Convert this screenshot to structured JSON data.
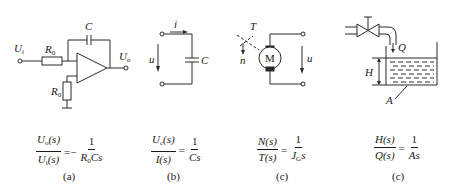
{
  "figure": {
    "panels": [
      {
        "id": "a",
        "caption": "(a)",
        "labels": {
          "input": "U",
          "input_sub": "i",
          "output": "U",
          "output_sub": "o",
          "resistor1": "R",
          "resistor1_sub": "0",
          "resistor2": "R",
          "resistor2_sub": "0",
          "capacitor": "C"
        },
        "equation": {
          "lhs_num": "U",
          "lhs_num_sub": "o",
          "lhs_num_arg": "(s)",
          "lhs_den": "U",
          "lhs_den_sub": "i",
          "lhs_den_arg": "(s)",
          "sign": "=−",
          "rhs_num": "1",
          "rhs_den": "R",
          "rhs_den_sub": "0",
          "rhs_den_rest": "Cs"
        }
      },
      {
        "id": "b",
        "caption": "(b)",
        "labels": {
          "current": "i",
          "voltage": "u",
          "capacitor": "C"
        },
        "equation": {
          "lhs_num": "U",
          "lhs_num_sub": "c",
          "lhs_num_arg": "(s)",
          "lhs_den": "I(s)",
          "sign": "=",
          "rhs_num": "1",
          "rhs_den": "Cs"
        }
      },
      {
        "id": "c1",
        "caption": "(c)",
        "labels": {
          "torque": "T",
          "speed": "n",
          "motor": "M",
          "voltage": "u"
        },
        "equation": {
          "lhs_num": "N(s)",
          "lhs_den": "T(s)",
          "sign": "=",
          "rhs_num": "1",
          "rhs_den": "J",
          "rhs_den_sub": "G",
          "rhs_den_rest": "s"
        }
      },
      {
        "id": "c2",
        "caption": "(c)",
        "labels": {
          "flow": "Q",
          "height": "H",
          "area": "A"
        },
        "equation": {
          "lhs_num": "H(s)",
          "lhs_den": "Q(s)",
          "sign": "=",
          "rhs_num": "1",
          "rhs_den": "As"
        }
      }
    ]
  }
}
